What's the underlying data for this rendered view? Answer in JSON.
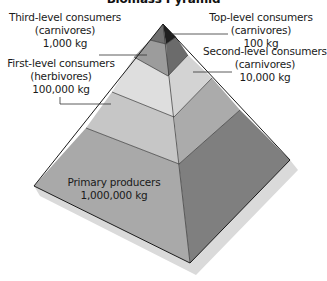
{
  "title": "Biomass Pyramid",
  "levels": [
    {
      "name": "Top-level consumers",
      "sub": "(carnivores)",
      "mass": "100 kg",
      "tier": 1
    },
    {
      "name": "Third-level consumers",
      "sub": "(carnivores)",
      "mass": "1,000 kg",
      "tier": 2
    },
    {
      "name": "Second-level consumers",
      "sub": "(carnivores)",
      "mass": "10,000 kg",
      "tier": 3
    },
    {
      "name": "First-level consumers",
      "sub": "(herbivores)",
      "mass": "100,000 kg",
      "tier": 4
    },
    {
      "name": "Primary producers",
      "mass": "1,000,000 kg",
      "tier": 5
    }
  ],
  "colors": {
    "tier1_left": "#6e6e6e",
    "tier1_right": "#1e1e1e",
    "tier2_left": "#9a9a9a",
    "tier2_right": "#6a6a6a",
    "tier3_left": "#dcdcdc",
    "tier3_right": "#d2d2d2",
    "tier4_left": "#c4c4c4",
    "tier4_right": "#a9a9a9",
    "tier5_left": "#a8a8a8",
    "tier5_right": "#7e7e7e",
    "shadow": "#d9d9d9",
    "outline": "#222222"
  }
}
